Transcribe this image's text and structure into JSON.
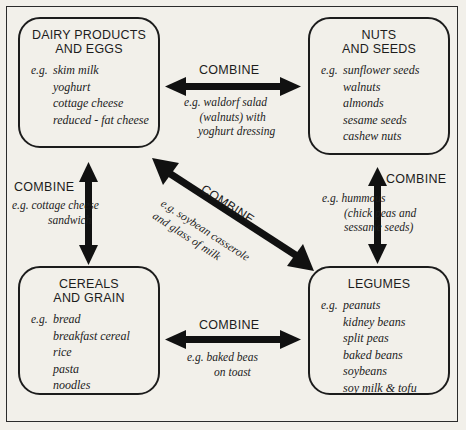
{
  "diagram": {
    "ink_color": "#1c1c1c",
    "background_color": "#f2f0ea"
  },
  "groups": {
    "dairy": {
      "title_line1": "DAIRY PRODUCTS",
      "title_line2": "AND EGGS",
      "eg_label": "e.g.",
      "items": [
        "skim milk",
        "yoghurt",
        "cottage cheese",
        "reduced - fat cheese"
      ]
    },
    "nuts": {
      "title_line1": "NUTS",
      "title_line2": "AND SEEDS",
      "eg_label": "e.g.",
      "items": [
        "sunflower seeds",
        "walnuts",
        "almonds",
        "sesame seeds",
        "cashew nuts"
      ]
    },
    "cereals": {
      "title_line1": "CEREALS",
      "title_line2": "AND GRAIN",
      "eg_label": "e.g.",
      "items": [
        "bread",
        "breakfast cereal",
        "rice",
        "pasta",
        "noodles"
      ]
    },
    "legumes": {
      "title_line1": "LEGUMES",
      "title_line2": "",
      "eg_label": "e.g.",
      "items": [
        "peanuts",
        "kidney beans",
        "split peas",
        "baked beans",
        "soybeans",
        "soy milk & tofu"
      ]
    }
  },
  "connectors": {
    "top": {
      "label": "COMBINE",
      "example_line1": "e.g. waldorf salad",
      "example_line2": "(walnuts) with",
      "example_line3": "yoghurt dressing",
      "from": "dairy",
      "to": "nuts",
      "orientation": "horizontal"
    },
    "bottom": {
      "label": "COMBINE",
      "example_line1": "e.g. baked beas",
      "example_line2": "on toast",
      "from": "cereals",
      "to": "legumes",
      "orientation": "horizontal"
    },
    "left": {
      "label": "COMBINE",
      "example_line1": "e.g. cottage cheese",
      "example_line2": "sandwich",
      "from": "dairy",
      "to": "cereals",
      "orientation": "vertical"
    },
    "right": {
      "label": "COMBINE",
      "example_line1": "e.g. hummous",
      "example_line2": "(chick peas and",
      "example_line3": "sessame seeds)",
      "from": "nuts",
      "to": "legumes",
      "orientation": "vertical"
    },
    "diagonal": {
      "label": "COMBINE",
      "example_line1": "e.g. soybean casserole",
      "example_line2": "and glass of milk",
      "from": "dairy",
      "to": "legumes",
      "orientation": "diagonal"
    }
  }
}
